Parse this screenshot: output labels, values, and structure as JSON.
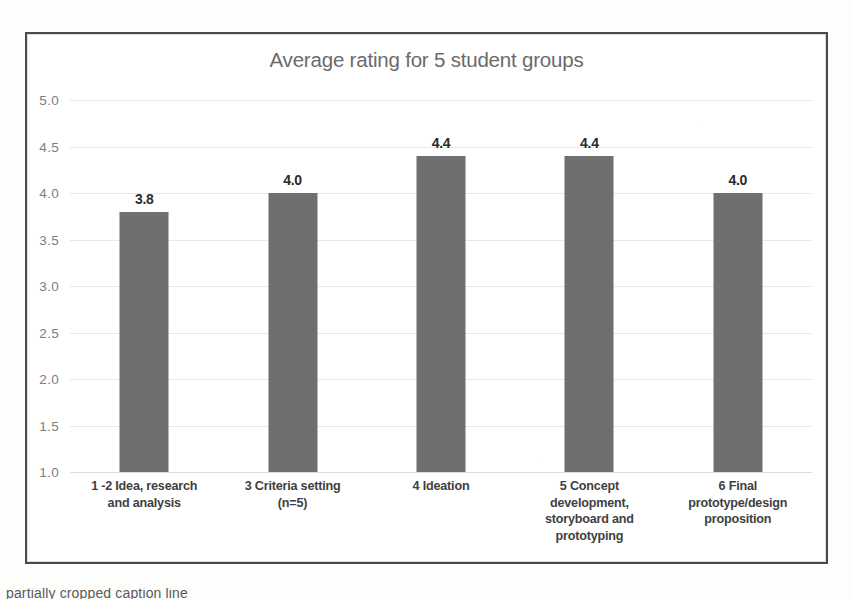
{
  "chart_data": {
    "type": "bar",
    "title": "Average rating for 5 student groups",
    "xlabel": "",
    "ylabel": "",
    "categories": [
      "1 -2 Idea, research and analysis",
      "3 Criteria setting (n=5)",
      "4 Ideation",
      "5 Concept development, storyboard and prototyping",
      "6 Final prototype/design proposition"
    ],
    "category_lines": [
      [
        "1 -2 Idea, research",
        "and analysis"
      ],
      [
        "3 Criteria setting",
        "(n=5)"
      ],
      [
        "4 Ideation"
      ],
      [
        "5 Concept",
        "development,",
        "storyboard and",
        "prototyping"
      ],
      [
        "6 Final",
        "prototype/design",
        "proposition"
      ]
    ],
    "values": [
      3.8,
      4.0,
      4.4,
      4.4,
      4.0
    ],
    "value_labels": [
      "3.8",
      "4.0",
      "4.4",
      "4.4",
      "4.0"
    ],
    "ylim": [
      1.0,
      5.0
    ],
    "ytick_values": [
      5.0,
      4.5,
      4.0,
      3.5,
      3.0,
      2.5,
      2.0,
      1.5,
      1.0
    ],
    "ytick_labels": [
      "5.0",
      "4.5",
      "4.0",
      "3.5",
      "3.0",
      "2.5",
      "2.0",
      "1.5",
      "1.0"
    ],
    "grid": true,
    "legend": false,
    "legend_position": "none",
    "bar_color": "#6f6f6f",
    "title_color": "#6b6b6b",
    "gridline_color": "#e8e8e6",
    "value_label_color": "#2b2b2b",
    "tick_label_color": "#7d7d7d",
    "frame_color": "#4a4a4a"
  },
  "caption": {
    "text": "partially cropped caption line"
  }
}
